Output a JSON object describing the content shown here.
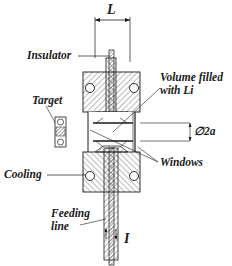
{
  "diagram": {
    "type": "cross-section schematic",
    "labels": {
      "length": "L",
      "insulator": "Insulator",
      "volume_line1": "Volume filled",
      "volume_line2": "with Li",
      "target": "Target",
      "diameter": "∅2a",
      "windows": "Windows",
      "cooling": "Cooling",
      "feeding_line1": "Feeding",
      "feeding_line2": "line",
      "current": "I"
    },
    "colors": {
      "line": "#1a1a1a",
      "hatch": "#555555",
      "background": "#ffffff"
    }
  }
}
